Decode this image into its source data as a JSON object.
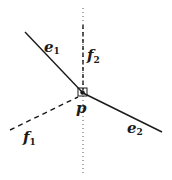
{
  "diagram": {
    "point": {
      "label": "p",
      "x": 83,
      "y": 93
    },
    "edges": [
      {
        "id": "e1",
        "base": "e",
        "sub": "1",
        "style": "solid",
        "from": [
          25,
          32
        ],
        "to": [
          83,
          93
        ],
        "label_pos": [
          47,
          52
        ]
      },
      {
        "id": "e2",
        "base": "e",
        "sub": "2",
        "style": "solid",
        "from": [
          83,
          93
        ],
        "to": [
          162,
          132
        ],
        "label_pos": [
          128,
          133
        ]
      }
    ],
    "faces": [
      {
        "id": "f1",
        "base": "f",
        "sub": "1",
        "style": "dashed",
        "from": [
          10,
          130
        ],
        "to": [
          78,
          97
        ],
        "label_pos": [
          24,
          143
        ]
      },
      {
        "id": "f2",
        "base": "f",
        "sub": "2",
        "style": "dashed",
        "from": [
          83,
          90
        ],
        "to": [
          83,
          25
        ],
        "label_pos": [
          88,
          60
        ]
      }
    ],
    "vertical_line": {
      "style": "dotted",
      "x": 83,
      "top": 8,
      "bottom": 175
    },
    "colors": {
      "ink": "#1a1a1a",
      "background": "#ffffff"
    }
  }
}
